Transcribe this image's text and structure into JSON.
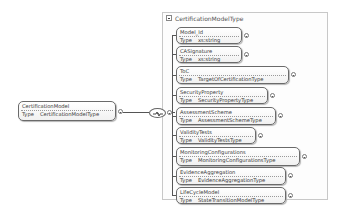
{
  "root": {
    "name": "CertificationModel",
    "type_label": "Type",
    "type": "CertificationModelType"
  },
  "group": {
    "title": "CertificationModelType",
    "compositor": "sequence"
  },
  "children": [
    {
      "name": "Model_Id",
      "type_label": "Type",
      "type": "xs:string"
    },
    {
      "name": "CASignature",
      "type_label": "Type",
      "type": "xs:string"
    },
    {
      "name": "ToC",
      "type_label": "Type",
      "type": "TargetOfCertificationType"
    },
    {
      "name": "SecurityProperty",
      "type_label": "Type",
      "type": "SecurityPropertyType"
    },
    {
      "name": "AssessmentScheme",
      "type_label": "Type",
      "type": "AssessmentSchemeType"
    },
    {
      "name": "ValidityTests",
      "type_label": "Type",
      "type": "ValidityTestsType"
    },
    {
      "name": "MonitoringConfigurations",
      "type_label": "Type",
      "type": "MonitoringConfigurationsType"
    },
    {
      "name": "EvidenceAggregation",
      "type_label": "Type",
      "type": "EvidenceAggregationType"
    },
    {
      "name": "LifeCycleModel",
      "type_label": "Type",
      "type": "StateTransitionModelType"
    }
  ]
}
